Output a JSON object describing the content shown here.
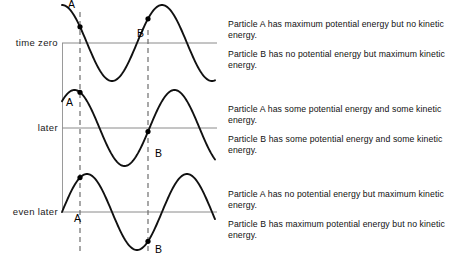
{
  "figure": {
    "axis_color": "#8a8a8a",
    "wave_color": "#111111",
    "dashed_color": "#6e6e6e",
    "point_color": "#000000",
    "background": "#ffffff"
  },
  "rows": [
    {
      "time_label": "time zero",
      "point_a_label": "A",
      "point_b_label": "B",
      "baseline_y": 43,
      "phase_deg": 0,
      "a_position": "crest",
      "b_position": "zero-crossing-rising",
      "statements": [
        "Particle A has maximum potential energy but no kinetic energy.",
        "Particle B has no potential energy but maximum kinetic energy."
      ]
    },
    {
      "time_label": "later",
      "point_a_label": "A",
      "point_b_label": "B",
      "baseline_y": 128,
      "phase_deg": 45,
      "a_position": "rising-flank",
      "b_position": "falling-below-axis",
      "statements": [
        "Particle A has some potential energy and some kinetic energy.",
        "Particle B has some potential energy and some kinetic energy."
      ]
    },
    {
      "time_label": "even later",
      "point_a_label": "A",
      "point_b_label": "B",
      "baseline_y": 212,
      "phase_deg": 90,
      "a_position": "zero-crossing-rising",
      "b_position": "trough",
      "statements": [
        "Particle A has no potential energy but maximum kinetic energy.",
        "Particle B has maximum potential energy but no kinetic energy."
      ]
    }
  ],
  "chart_data": {
    "type": "line",
    "xlabel": "",
    "ylabel": "",
    "x_start_px": 62,
    "x_end_px": 215,
    "amplitude_px": 38,
    "wavelength_px": 100,
    "cycles_shown": 1.5,
    "marker_a_x_px": 80,
    "marker_b_x_px": 148,
    "series": [
      {
        "name": "time zero",
        "phase_deg": 0,
        "baseline_y_px": 43,
        "a_value": 1.0,
        "b_value": 0.0
      },
      {
        "name": "later",
        "phase_deg": 45,
        "baseline_y_px": 128,
        "a_value": 0.7,
        "b_value": -0.7
      },
      {
        "name": "even later",
        "phase_deg": 90,
        "baseline_y_px": 212,
        "a_value": 0.0,
        "b_value": -1.0
      }
    ],
    "annotations": [
      "A",
      "B"
    ],
    "grid": false,
    "legend": "none"
  }
}
